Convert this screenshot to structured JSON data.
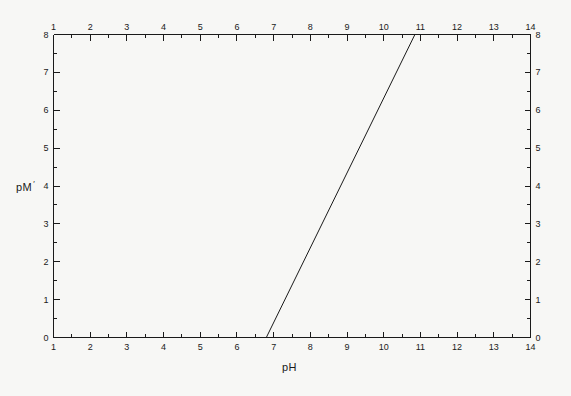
{
  "chart_data": {
    "type": "line",
    "title": "",
    "xlabel": "pH",
    "ylabel": "pM",
    "ylabel_suffix": "′",
    "xlim": [
      1,
      14
    ],
    "ylim": [
      0,
      8
    ],
    "x_major_step": 1,
    "x_minor_step": 0.5,
    "y_major_step": 1,
    "y_minor_step": 0.5,
    "grid": false,
    "legend": null,
    "axes": {
      "top_ticks_labeled": true,
      "bottom_ticks_labeled": true,
      "left_ticks_labeled": true,
      "right_ticks_labeled": true
    },
    "x_tick_labels": [
      "1",
      "2",
      "3",
      "4",
      "5",
      "6",
      "7",
      "8",
      "9",
      "10",
      "11",
      "12",
      "13",
      "14"
    ],
    "x_tick_values": [
      1,
      2,
      3,
      4,
      5,
      6,
      7,
      8,
      9,
      10,
      11,
      12,
      13,
      14
    ],
    "y_tick_labels": [
      "0",
      "1",
      "2",
      "3",
      "4",
      "5",
      "6",
      "7",
      "8"
    ],
    "y_tick_values": [
      0,
      1,
      2,
      3,
      4,
      5,
      6,
      7,
      8
    ],
    "series": [
      {
        "name": "conditional constant",
        "x": [
          6.8,
          10.85
        ],
        "values": [
          0.0,
          8.0
        ],
        "color": "#1a1a1a",
        "line_width": 1
      }
    ],
    "colors": {
      "background": "#f7f7f5",
      "axis": "#1a1a1a",
      "line": "#1a1a1a",
      "text": "#1a1a1a"
    }
  },
  "labels": {
    "x_axis_title": "pH",
    "y_axis_title": "pM"
  }
}
